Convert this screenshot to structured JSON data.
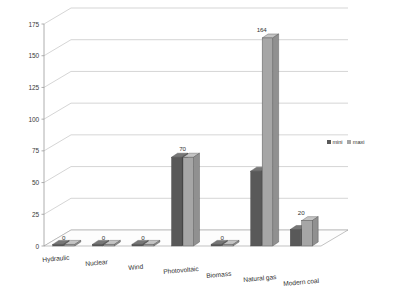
{
  "chart_data": {
    "type": "bar",
    "title": "",
    "xlabel": "",
    "ylabel": "",
    "ylim": [
      0,
      175
    ],
    "yticks": [
      0,
      25,
      50,
      75,
      100,
      125,
      150,
      175
    ],
    "ytick_labels": [
      "0",
      "25",
      "50",
      "75",
      "100",
      "125",
      "150",
      "175"
    ],
    "grid": true,
    "three_d": true,
    "legend_position": "right",
    "categories": [
      "Hydraulic",
      "Nuclear",
      "Wind",
      "Photovoltaic",
      "Biomass",
      "Natural gas",
      "Modern coal"
    ],
    "series": [
      {
        "name": "mini",
        "color": "#595959",
        "values": [
          0,
          0,
          0,
          70,
          0,
          59,
          13
        ]
      },
      {
        "name": "maxi",
        "color": "#a6a6a6",
        "values": [
          0,
          0,
          0,
          70,
          0,
          164,
          20
        ]
      }
    ],
    "data_labels": [
      "0",
      "0",
      "0",
      "70",
      "0",
      "164",
      "20"
    ]
  },
  "legend": {
    "entries": [
      {
        "label": "mini",
        "color": "#595959"
      },
      {
        "label": "maxi",
        "color": "#a6a6a6"
      }
    ]
  },
  "colors": {
    "series_mini": "#595959",
    "series_maxi": "#a6a6a6",
    "gridline": "#b9b9b9",
    "axis": "#9a9a9a",
    "floor": "#fdfdfd",
    "background": "#ffffff"
  }
}
